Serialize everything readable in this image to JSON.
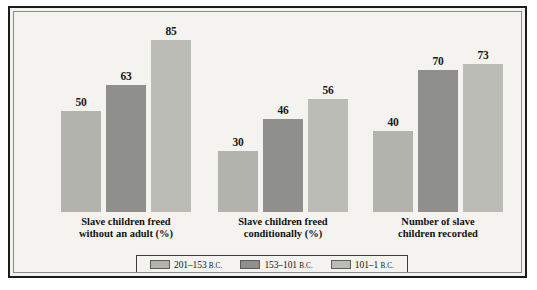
{
  "chart_data": {
    "type": "bar",
    "title": "",
    "subtitle": "",
    "xlabel": "",
    "ylabel": "",
    "ylim": [
      0,
      90
    ],
    "grid": false,
    "legend_position": "bottom",
    "categories": [
      "Slave children freed without an adult (%)",
      "Slave children freed conditionally (%)",
      "Number of slave children recorded"
    ],
    "category_lines": [
      [
        "Slave children freed",
        "without an adult (%)"
      ],
      [
        "Slave children freed",
        "conditionally (%)"
      ],
      [
        "Number of slave",
        "children recorded"
      ]
    ],
    "series": [
      {
        "name": "201–153 B.C.",
        "range": "201–153",
        "era": "B.C.",
        "color": "#b3b3ad",
        "values": [
          50,
          30,
          40
        ]
      },
      {
        "name": "153–101 B.C.",
        "range": "153–101",
        "era": "B.C.",
        "color": "#8f8f8b",
        "values": [
          63,
          46,
          70
        ]
      },
      {
        "name": "101–1 B.C.",
        "range": "101–1",
        "era": "B.C.",
        "color": "#bcbcb7",
        "values": [
          85,
          56,
          73
        ]
      }
    ],
    "value_labels": [
      [
        "50",
        "63",
        "85"
      ],
      [
        "30",
        "46",
        "56"
      ],
      [
        "40",
        "70",
        "73"
      ]
    ]
  },
  "frame": {
    "outer_border_color": "#1c1c1c",
    "inner_border_color": "#8d8d88",
    "background_color": "#f4f3f0"
  },
  "legend": {
    "items": [
      {
        "label_range": "201–153",
        "label_era": "B.C.",
        "swatch_color": "#b3b3ad"
      },
      {
        "label_range": "153–101",
        "label_era": "B.C.",
        "swatch_color": "#8f8f8b"
      },
      {
        "label_range": "101–1",
        "label_era": "B.C.",
        "swatch_color": "#bcbcb7"
      }
    ]
  }
}
